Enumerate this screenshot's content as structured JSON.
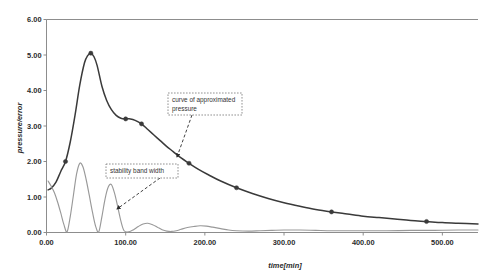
{
  "chart_data": {
    "type": "line",
    "title": "",
    "xlabel": "time[min]",
    "ylabel": "pressure/error",
    "xlim": [
      0,
      545
    ],
    "ylim": [
      0,
      6
    ],
    "grid": false,
    "legend_position": "none",
    "xticks": [
      "0.00",
      "100.00",
      "200.00",
      "300.00",
      "400.00",
      "500.00"
    ],
    "xtick_values": [
      0,
      100,
      200,
      300,
      400,
      500
    ],
    "yticks": [
      "0.00",
      "1.00",
      "2.00",
      "3.00",
      "4.00",
      "5.00",
      "6.00"
    ],
    "ytick_values": [
      0,
      1,
      2,
      3,
      4,
      5,
      6
    ],
    "series": [
      {
        "name": "curve of approximated pressure",
        "color": "#3a3a3a",
        "x": [
          2,
          6,
          12,
          18,
          24,
          30,
          36,
          42,
          48,
          52,
          56,
          60,
          64,
          70,
          76,
          82,
          88,
          94,
          100,
          106,
          112,
          120,
          128,
          136,
          144,
          152,
          160,
          170,
          180,
          192,
          205,
          220,
          240,
          260,
          280,
          300,
          320,
          340,
          360,
          380,
          400,
          420,
          440,
          460,
          480,
          500,
          520,
          545
        ],
        "y": [
          1.2,
          1.25,
          1.42,
          1.72,
          2.0,
          2.55,
          3.3,
          4.15,
          4.78,
          4.98,
          5.05,
          4.95,
          4.7,
          4.12,
          3.72,
          3.46,
          3.3,
          3.22,
          3.2,
          3.2,
          3.16,
          3.06,
          2.9,
          2.74,
          2.58,
          2.42,
          2.28,
          2.1,
          1.95,
          1.78,
          1.62,
          1.45,
          1.26,
          1.1,
          0.96,
          0.84,
          0.74,
          0.65,
          0.58,
          0.52,
          0.46,
          0.42,
          0.38,
          0.34,
          0.31,
          0.28,
          0.26,
          0.24
        ],
        "markers": [
          {
            "x": 24,
            "y": 2.0
          },
          {
            "x": 56,
            "y": 5.05
          },
          {
            "x": 100,
            "y": 3.2
          },
          {
            "x": 120,
            "y": 3.06
          },
          {
            "x": 180,
            "y": 1.95
          },
          {
            "x": 240,
            "y": 1.26
          },
          {
            "x": 360,
            "y": 0.58
          },
          {
            "x": 480,
            "y": 0.31
          }
        ]
      },
      {
        "name": "stability band width",
        "color": "#999999",
        "x": [
          2,
          6,
          10,
          14,
          18,
          22,
          26,
          30,
          34,
          38,
          42,
          46,
          50,
          54,
          58,
          62,
          66,
          70,
          74,
          78,
          82,
          86,
          90,
          94,
          98,
          104,
          110,
          116,
          122,
          128,
          134,
          140,
          146,
          152,
          158,
          164,
          170,
          178,
          186,
          194,
          202,
          210,
          220,
          230,
          240,
          255,
          270,
          285,
          300,
          320,
          340,
          360,
          380,
          400,
          430,
          460,
          490,
          520,
          545
        ],
        "y": [
          1.45,
          1.3,
          1.12,
          0.86,
          0.55,
          0.22,
          0.02,
          0.45,
          1.05,
          1.65,
          1.95,
          1.85,
          1.5,
          1.05,
          0.58,
          0.18,
          0.02,
          0.45,
          0.95,
          1.28,
          1.35,
          1.1,
          0.72,
          0.32,
          0.05,
          0.02,
          0.08,
          0.17,
          0.24,
          0.26,
          0.22,
          0.15,
          0.08,
          0.04,
          0.03,
          0.05,
          0.09,
          0.14,
          0.17,
          0.19,
          0.18,
          0.15,
          0.11,
          0.07,
          0.05,
          0.04,
          0.05,
          0.06,
          0.07,
          0.07,
          0.06,
          0.05,
          0.05,
          0.05,
          0.05,
          0.06,
          0.06,
          0.07,
          0.07
        ],
        "markers": []
      }
    ],
    "annotations": [
      {
        "id": "annotation-approximated-pressure",
        "text_line1": "curve of approximated",
        "text_line2": "pressure",
        "box": {
          "x": 168,
          "y": 93,
          "width": 74,
          "height": 22
        },
        "arrow_from": {
          "x": 192,
          "y": 115
        },
        "arrow_to": {
          "x": 177,
          "y": 157
        }
      },
      {
        "id": "annotation-stability-band-width",
        "text_line1": "stability band width",
        "text_line2": "",
        "box": {
          "x": 106,
          "y": 164,
          "width": 72,
          "height": 14
        },
        "arrow_from": {
          "x": 160,
          "y": 178
        },
        "arrow_to": {
          "x": 117,
          "y": 209
        }
      }
    ]
  },
  "colors": {
    "pressure_curve": "#3a3a3a",
    "stability_curve": "#999999",
    "axis": "#808080",
    "text": "#2b2b2b",
    "annotation_border": "#777777",
    "background": "#ffffff"
  }
}
